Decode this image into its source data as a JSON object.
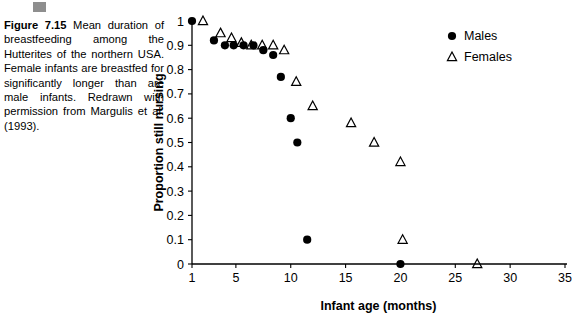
{
  "caption": {
    "figure_label": "Figure 7.15",
    "text": "Mean duration of breastfeeding among the Hutterites of the northern USA. Female infants are breastfed for significantly longer than are male infants. Redrawn with permission from Margulis et al. (1993)."
  },
  "legend": {
    "males_label": "Males",
    "females_label": "Females"
  },
  "chart_data": {
    "type": "scatter",
    "title": "",
    "xlabel": "Infant age (months)",
    "ylabel": "Proportion still nursing",
    "xlim": [
      1,
      35
    ],
    "ylim": [
      0,
      1
    ],
    "xticks": [
      1,
      5,
      10,
      15,
      20,
      25,
      30,
      35
    ],
    "xtick_labels": [
      "1",
      "5",
      "10",
      "15",
      "20",
      "25",
      "30",
      "35"
    ],
    "yticks": [
      0,
      0.1,
      0.2,
      0.3,
      0.4,
      0.5,
      0.6,
      0.7,
      0.8,
      0.9,
      1
    ],
    "ytick_labels": [
      "0",
      "0.1",
      "0.2",
      "0.3",
      "0.4",
      "0.5",
      "0.6",
      "0.7",
      "0.8",
      "0.9",
      "1"
    ],
    "grid": false,
    "legend_position": "top-right",
    "series": [
      {
        "name": "Males",
        "marker": "filled-circle",
        "color": "#000000",
        "points": [
          [
            1,
            1.0
          ],
          [
            3,
            0.92
          ],
          [
            4,
            0.9
          ],
          [
            4.8,
            0.9
          ],
          [
            5.7,
            0.9
          ],
          [
            6.6,
            0.9
          ],
          [
            7.5,
            0.88
          ],
          [
            8.4,
            0.86
          ],
          [
            9.1,
            0.77
          ],
          [
            10.0,
            0.6
          ],
          [
            10.6,
            0.5
          ],
          [
            11.5,
            0.1
          ],
          [
            20,
            0
          ]
        ]
      },
      {
        "name": "Females",
        "marker": "open-triangle",
        "color": "#000000",
        "points": [
          [
            2,
            1.0
          ],
          [
            3.6,
            0.95
          ],
          [
            4.6,
            0.93
          ],
          [
            5.5,
            0.91
          ],
          [
            6.4,
            0.9
          ],
          [
            7.4,
            0.9
          ],
          [
            8.4,
            0.9
          ],
          [
            9.4,
            0.88
          ],
          [
            10.5,
            0.75
          ],
          [
            12.0,
            0.65
          ],
          [
            15.5,
            0.58
          ],
          [
            17.6,
            0.5
          ],
          [
            20.0,
            0.42
          ],
          [
            20.2,
            0.1
          ],
          [
            27.0,
            0
          ]
        ]
      }
    ]
  }
}
